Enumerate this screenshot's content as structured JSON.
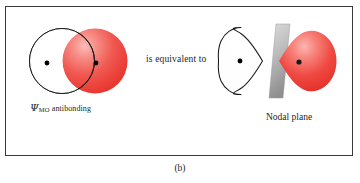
{
  "figure": {
    "caption": "(b)",
    "border_color": "#3a3a3a",
    "background": "#ffffff"
  },
  "labels": {
    "mo_symbol": "Ψ",
    "mo_subscript": "MO",
    "mo_rest": " antibonding",
    "equivalent_text": "is equivalent to",
    "nodal_plane_text": "Nodal plane"
  },
  "left_panel": {
    "name": "overlapping-atomic-orbitals",
    "white_lobe": {
      "shape": "circle",
      "fill": "#ffffff",
      "stroke": "#1a1a1a",
      "nucleus_color": "#000000"
    },
    "red_lobe": {
      "shape": "circle",
      "fill": "#ef3e3a",
      "highlight": "#f8a9a4",
      "nucleus_color": "#000000"
    }
  },
  "right_panel": {
    "name": "molecular-orbital-with-nodal-plane",
    "white_lobe": {
      "shape": "teardrop",
      "fill": "#ffffff",
      "stroke": "#1a1a1a",
      "nucleus_color": "#000000"
    },
    "red_lobe": {
      "shape": "teardrop",
      "fill": "#ef3e3a",
      "highlight": "#f79490",
      "nucleus_color": "#000000"
    },
    "nodal_plane": {
      "shape": "parallelogram",
      "fill_top": "#cfcfcf",
      "fill_bottom": "#9a9a9a",
      "edge": "#8a8a8a"
    }
  }
}
